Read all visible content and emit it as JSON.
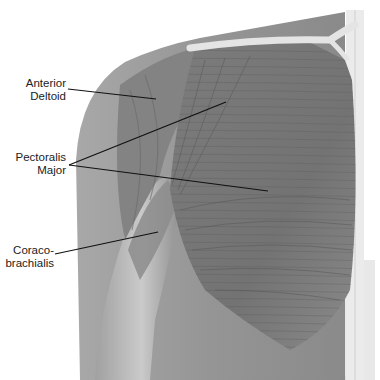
{
  "figure": {
    "style": "grayscale anatomical illustration"
  },
  "labels": [
    {
      "id": "anterior-deltoid",
      "lines": [
        "Anterior",
        "Deltoid"
      ]
    },
    {
      "id": "pectoralis-major",
      "lines": [
        "Pectoralis",
        "Major"
      ]
    },
    {
      "id": "coracobrachialis",
      "lines": [
        "Coraco-",
        "brachialis"
      ]
    }
  ],
  "colors": {
    "background": "#ffffff",
    "skin": "#9a9a9a",
    "muscle_dark": "#6e6e6e",
    "muscle_mid": "#858585",
    "bone": "#e6e6e6",
    "leader_line": "#111111",
    "text": "#222222"
  }
}
